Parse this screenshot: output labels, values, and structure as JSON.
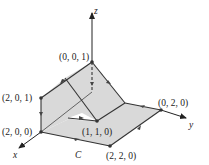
{
  "figure": {
    "axes": {
      "x": "x",
      "y": "y",
      "z": "z"
    },
    "curve_label": "C",
    "points": {
      "p001": "(0, 0, 1)",
      "p201": "(2, 0, 1)",
      "p200": "(2, 0, 0)",
      "p110": "(1, 1, 0)",
      "p020": "(0, 2, 0)",
      "p220": "(2, 2, 0)"
    },
    "colors": {
      "surface": "#d9d9d9",
      "line": "#333333",
      "background": "#ffffff"
    }
  }
}
